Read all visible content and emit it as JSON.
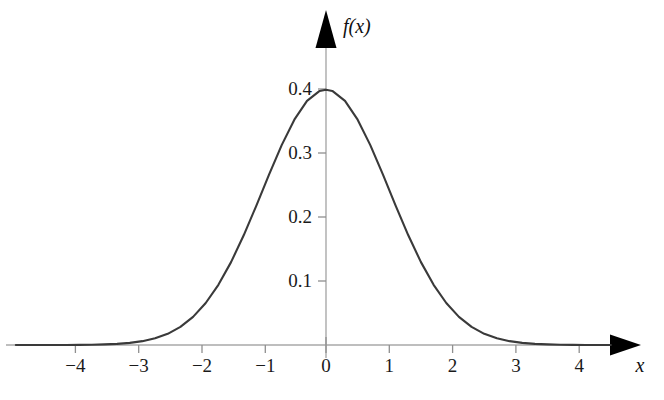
{
  "figure": {
    "background_color": "#ffffff",
    "curve_color": "#3a3a3a",
    "axis_color": "#a9a9a9",
    "arrow_color": "#000000",
    "text_color": "#1a1a1a"
  },
  "axes": {
    "x_axis_label": "x",
    "y_axis_label": "f(x)",
    "x_ticks": [
      "−4",
      "−3",
      "−2",
      "−1",
      "0",
      "1",
      "2",
      "3",
      "4"
    ],
    "y_ticks": [
      "0.1",
      "0.2",
      "0.3",
      "0.4"
    ]
  },
  "chart_data": {
    "type": "line",
    "title": "",
    "subtitle": "",
    "xlabel": "x",
    "ylabel": "f(x)",
    "xlim": [
      -4.9,
      4.5
    ],
    "ylim": [
      0,
      0.44
    ],
    "grid": false,
    "legend": "none",
    "annotations": [],
    "x_tick_values": [
      -4,
      -3,
      -2,
      -1,
      0,
      1,
      2,
      3,
      4
    ],
    "x_tick_labels": [
      "−4",
      "−3",
      "−2",
      "−1",
      "0",
      "1",
      "2",
      "3",
      "4"
    ],
    "y_tick_values": [
      0.1,
      0.2,
      0.3,
      0.4
    ],
    "y_tick_labels": [
      "0.1",
      "0.2",
      "0.3",
      "0.4"
    ],
    "series": [
      {
        "name": "standard normal probability density",
        "formula": "f(x) = (1/sqrt(2*pi)) * exp(-x^2/2)",
        "x": [
          -4.9,
          -4.7,
          -4.5,
          -4.3,
          -4.1,
          -3.9,
          -3.7,
          -3.5,
          -3.3,
          -3.1,
          -2.9,
          -2.7,
          -2.5,
          -2.3,
          -2.1,
          -1.9,
          -1.7,
          -1.5,
          -1.3,
          -1.1,
          -0.9,
          -0.7,
          -0.5,
          -0.3,
          -0.1,
          0,
          0.1,
          0.3,
          0.5,
          0.7,
          0.9,
          1.1,
          1.3,
          1.5,
          1.7,
          1.9,
          2.1,
          2.3,
          2.5,
          2.7,
          2.9,
          3.1,
          3.3,
          3.5,
          3.7,
          3.9,
          4.1,
          4.3,
          4.5
        ],
        "y": [
          0.0,
          0.0,
          0.0,
          0.0,
          0.0001,
          0.0002,
          0.0004,
          0.0009,
          0.0017,
          0.0033,
          0.006,
          0.0104,
          0.0175,
          0.0283,
          0.044,
          0.0656,
          0.094,
          0.1295,
          0.1714,
          0.2179,
          0.2661,
          0.3123,
          0.3521,
          0.3814,
          0.397,
          0.3989,
          0.397,
          0.3814,
          0.3521,
          0.3123,
          0.2661,
          0.2179,
          0.1714,
          0.1295,
          0.094,
          0.0656,
          0.044,
          0.0283,
          0.0175,
          0.0104,
          0.006,
          0.0033,
          0.0017,
          0.0009,
          0.0004,
          0.0002,
          0.0001,
          0.0,
          0.0
        ]
      }
    ],
    "peak": {
      "x": 0,
      "y": 0.3989
    }
  }
}
